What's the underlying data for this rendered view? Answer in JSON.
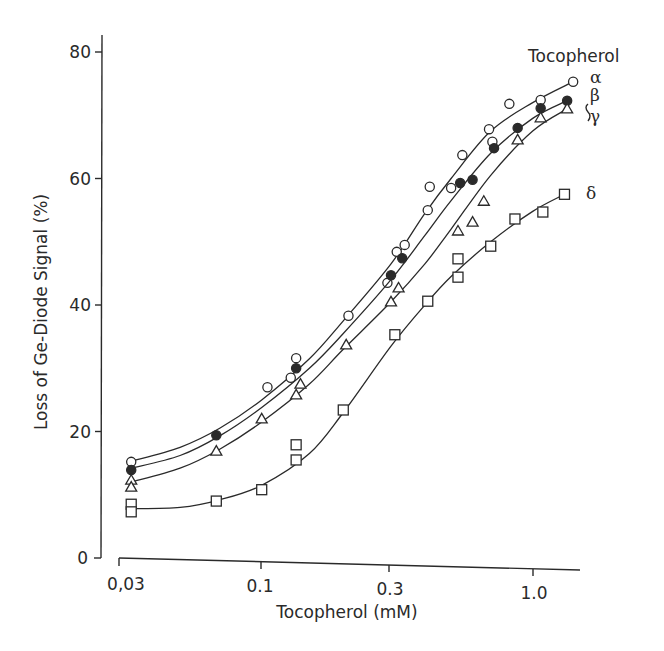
{
  "chart_data": {
    "type": "scatter",
    "title": "",
    "xlabel": "Tocopherol (mM)",
    "ylabel": "Loss of Ge-Diode Signal (%)",
    "xscale": "log",
    "xlim": [
      0.03,
      1.5
    ],
    "ylim": [
      0,
      80
    ],
    "x_ticks": [
      0.03,
      0.1,
      0.3,
      1.0
    ],
    "x_tick_labels": [
      "0,03",
      "0.1",
      "0.3",
      "1.0"
    ],
    "y_ticks": [
      0,
      20,
      40,
      60,
      80
    ],
    "y_tick_labels": [
      "0",
      "20",
      "40",
      "60",
      "80"
    ],
    "grid": false,
    "legend": {
      "title": "Tocopherol",
      "position": "right"
    },
    "series": [
      {
        "name": "α",
        "label": "α",
        "marker": "open-circle",
        "fit_curve": true,
        "points": [
          [
            0.033,
            15.2
          ],
          [
            0.105,
            27.0
          ],
          [
            0.128,
            28.5
          ],
          [
            0.134,
            31.6
          ],
          [
            0.209,
            38.3
          ],
          [
            0.291,
            43.5
          ],
          [
            0.315,
            48.4
          ],
          [
            0.337,
            49.5
          ],
          [
            0.41,
            55.0
          ],
          [
            0.417,
            58.7
          ],
          [
            0.5,
            58.5
          ],
          [
            0.55,
            63.7
          ],
          [
            0.69,
            67.8
          ],
          [
            0.71,
            65.8
          ],
          [
            0.82,
            71.8
          ],
          [
            1.07,
            72.4
          ],
          [
            1.41,
            75.3
          ]
        ],
        "curve": [
          [
            0.033,
            15.3
          ],
          [
            0.05,
            17.5
          ],
          [
            0.07,
            20.5
          ],
          [
            0.1,
            25.0
          ],
          [
            0.15,
            31.5
          ],
          [
            0.2,
            37.5
          ],
          [
            0.3,
            46.5
          ],
          [
            0.4,
            54.5
          ],
          [
            0.5,
            60.0
          ],
          [
            0.7,
            67.5
          ],
          [
            1.0,
            72.0
          ],
          [
            1.41,
            75.3
          ]
        ]
      },
      {
        "name": "β",
        "label": "β",
        "marker": "filled-circle",
        "fit_curve": true,
        "points": [
          [
            0.033,
            13.9
          ],
          [
            0.068,
            19.4
          ],
          [
            0.134,
            30.0
          ],
          [
            0.3,
            44.7
          ],
          [
            0.33,
            47.4
          ],
          [
            0.54,
            59.3
          ],
          [
            0.6,
            59.8
          ],
          [
            0.72,
            64.8
          ],
          [
            0.88,
            68.0
          ],
          [
            1.07,
            71.1
          ],
          [
            1.34,
            72.3
          ]
        ],
        "curve": [
          [
            0.033,
            14.2
          ],
          [
            0.05,
            16.2
          ],
          [
            0.07,
            19.3
          ],
          [
            0.1,
            23.8
          ],
          [
            0.15,
            30.0
          ],
          [
            0.2,
            35.5
          ],
          [
            0.3,
            44.0
          ],
          [
            0.4,
            51.0
          ],
          [
            0.5,
            56.5
          ],
          [
            0.7,
            64.0
          ],
          [
            1.0,
            69.5
          ],
          [
            1.34,
            72.3
          ]
        ]
      },
      {
        "name": "γ",
        "label": "γ",
        "marker": "open-triangle",
        "fit_curve": true,
        "points": [
          [
            0.033,
            12.3
          ],
          [
            0.033,
            11.2
          ],
          [
            0.068,
            16.9
          ],
          [
            0.1,
            22.0
          ],
          [
            0.134,
            25.8
          ],
          [
            0.139,
            27.5
          ],
          [
            0.205,
            33.7
          ],
          [
            0.3,
            40.5
          ],
          [
            0.32,
            42.7
          ],
          [
            0.53,
            51.7
          ],
          [
            0.6,
            53.1
          ],
          [
            0.66,
            56.4
          ],
          [
            0.88,
            66.1
          ],
          [
            1.07,
            69.6
          ],
          [
            1.34,
            71.0
          ]
        ],
        "curve": [
          [
            0.033,
            12.0
          ],
          [
            0.05,
            14.2
          ],
          [
            0.07,
            17.2
          ],
          [
            0.1,
            21.5
          ],
          [
            0.15,
            27.5
          ],
          [
            0.2,
            33.0
          ],
          [
            0.3,
            40.5
          ],
          [
            0.4,
            46.5
          ],
          [
            0.5,
            52.0
          ],
          [
            0.7,
            60.5
          ],
          [
            1.0,
            67.5
          ],
          [
            1.34,
            71.0
          ]
        ]
      },
      {
        "name": "δ",
        "label": "δ",
        "marker": "open-square",
        "fit_curve": true,
        "points": [
          [
            0.033,
            8.5
          ],
          [
            0.033,
            7.3
          ],
          [
            0.068,
            9.0
          ],
          [
            0.1,
            10.8
          ],
          [
            0.134,
            15.5
          ],
          [
            0.134,
            17.9
          ],
          [
            0.2,
            23.4
          ],
          [
            0.31,
            35.3
          ],
          [
            0.41,
            40.6
          ],
          [
            0.53,
            44.4
          ],
          [
            0.53,
            47.3
          ],
          [
            0.7,
            49.3
          ],
          [
            0.86,
            53.6
          ],
          [
            1.09,
            54.7
          ],
          [
            1.31,
            57.5
          ]
        ],
        "curve": [
          [
            0.033,
            7.8
          ],
          [
            0.05,
            8.0
          ],
          [
            0.07,
            9.2
          ],
          [
            0.1,
            11.5
          ],
          [
            0.15,
            16.5
          ],
          [
            0.2,
            23.0
          ],
          [
            0.3,
            33.5
          ],
          [
            0.4,
            40.0
          ],
          [
            0.5,
            44.5
          ],
          [
            0.7,
            50.0
          ],
          [
            1.0,
            54.8
          ],
          [
            1.31,
            57.5
          ]
        ]
      }
    ]
  },
  "labels": {
    "legend_title": "Tocopherol",
    "alpha": "α",
    "beta": "β",
    "gamma": "γ",
    "delta": "δ",
    "xlabel": "Tocopherol (mM)",
    "ylabel": "Loss of Ge-Diode Signal (%)",
    "x_ticks": [
      "0,03",
      "0.1",
      "0.3",
      "1.0"
    ],
    "y_ticks": [
      "0",
      "20",
      "40",
      "60",
      "80"
    ]
  }
}
